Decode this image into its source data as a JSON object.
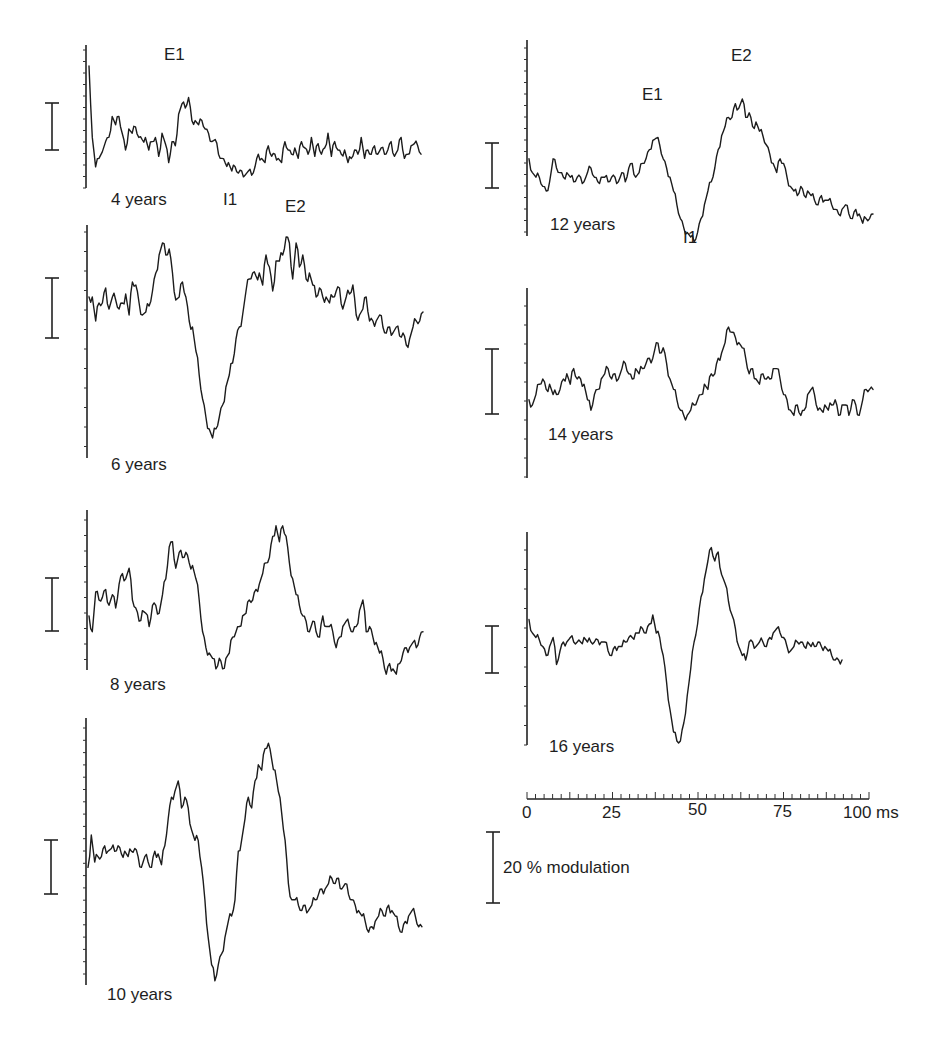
{
  "figure": {
    "time_axis": {
      "tick_labels": [
        "0",
        "25",
        "50",
        "75",
        "100 ms"
      ],
      "label_0": "0",
      "label_25": "25",
      "label_50": "50",
      "label_75": "75",
      "label_100": "100 ms",
      "minor_tick_ms": 2.5,
      "range_ms": [
        0,
        100
      ]
    },
    "amplitude_scale": {
      "label": "20 % modulation",
      "value_percent": 20
    },
    "panel_labels": {
      "p4": "4 years",
      "p6": "6 years",
      "p8": "8 years",
      "p10": "10 years",
      "p12": "12 years",
      "p14": "14 years",
      "p16": "16 years"
    },
    "peak_labels": {
      "p4_E1": "E1",
      "p4_I1": "I1",
      "p4_E2": "E2",
      "p12_E1": "E1",
      "p12_I1": "I1",
      "p12_E2": "E2"
    }
  },
  "chart_data": [
    {
      "type": "line",
      "title": "4 years",
      "xlabel": "Time (ms)",
      "ylabel": "% modulation",
      "xlim": [
        0,
        100
      ],
      "annotations": [
        {
          "text": "E1",
          "x": 24
        },
        {
          "text": "I1",
          "x": 42
        },
        {
          "text": "E2",
          "x": 62
        }
      ],
      "x": [
        0,
        1,
        2,
        3,
        5,
        6,
        7,
        8,
        9,
        10,
        11,
        12,
        13,
        14,
        15,
        16,
        17,
        18,
        19,
        20,
        21,
        22,
        23,
        24,
        25,
        26,
        27,
        28,
        29,
        30,
        31,
        32,
        33,
        34,
        35,
        36,
        37,
        38,
        39,
        40,
        41,
        42,
        43,
        44,
        45,
        46,
        47,
        48,
        49,
        50,
        51,
        52,
        53,
        54,
        55,
        56,
        57,
        58,
        59,
        60,
        61,
        62,
        63,
        64,
        65,
        66,
        67,
        68,
        69,
        70,
        71,
        72,
        73,
        74,
        75,
        76,
        77,
        78,
        79,
        80,
        81,
        82,
        83,
        84,
        85,
        86,
        87,
        88,
        89,
        90,
        91,
        92,
        93,
        94,
        95,
        96,
        97,
        98,
        99,
        100
      ],
      "y": [
        40,
        6,
        -8,
        -4,
        4,
        6,
        16,
        12,
        16,
        8,
        0,
        10,
        8,
        11,
        6,
        5,
        6,
        0,
        4,
        6,
        -3,
        8,
        3,
        -6,
        4,
        2,
        17,
        22,
        20,
        25,
        14,
        14,
        12,
        14,
        10,
        8,
        4,
        5,
        -2,
        -4,
        -6,
        -6,
        -10,
        -8,
        -11,
        -10,
        -12,
        -10,
        -12,
        -8,
        -2,
        -4,
        -6,
        2,
        -3,
        -2,
        -4,
        -6,
        4,
        0,
        -2,
        1,
        -4,
        4,
        1,
        -2,
        6,
        -3,
        3,
        -2,
        1,
        8,
        -3,
        4,
        0,
        -2,
        0,
        -6,
        -4,
        0,
        -2,
        6,
        -4,
        0,
        -2,
        2,
        -2,
        1,
        -2,
        0,
        4,
        -3,
        0,
        6,
        -4,
        -2,
        2,
        3,
        2,
        -2
      ]
    },
    {
      "type": "line",
      "title": "6 years",
      "xlabel": "Time (ms)",
      "ylabel": "% modulation",
      "xlim": [
        0,
        100
      ],
      "x": [
        0,
        1,
        2,
        3,
        4,
        5,
        6,
        7,
        8,
        9,
        10,
        11,
        12,
        13,
        14,
        15,
        16,
        17,
        18,
        19,
        20,
        21,
        22,
        23,
        24,
        25,
        26,
        27,
        28,
        29,
        30,
        31,
        32,
        33,
        34,
        35,
        36,
        37,
        38,
        39,
        40,
        41,
        42,
        43,
        44,
        45,
        46,
        47,
        48,
        49,
        50,
        51,
        52,
        53,
        54,
        55,
        56,
        57,
        58,
        59,
        60,
        61,
        62,
        63,
        64,
        65,
        66,
        67,
        68,
        69,
        70,
        71,
        72,
        73,
        74,
        75,
        76,
        77,
        78,
        79,
        80,
        81,
        82,
        83,
        84,
        85,
        86,
        87,
        88,
        89,
        90,
        91,
        92,
        93,
        94,
        95,
        96,
        97,
        98,
        99,
        100
      ],
      "y": [
        0,
        0,
        -8,
        -2,
        -2,
        3,
        -4,
        0,
        -1,
        -4,
        -2,
        1,
        -6,
        5,
        4,
        -2,
        -6,
        -5,
        -3,
        2,
        8,
        14,
        18,
        14,
        16,
        8,
        -1,
        0,
        5,
        0,
        -8,
        -10,
        -18,
        -26,
        -34,
        -40,
        -44,
        -47,
        -44,
        -40,
        -36,
        -30,
        -26,
        -22,
        -14,
        -10,
        -6,
        2,
        6,
        8,
        7,
        8,
        4,
        14,
        10,
        2,
        12,
        12,
        14,
        20,
        18,
        6,
        18,
        10,
        14,
        6,
        8,
        4,
        0,
        3,
        0,
        0,
        -2,
        0,
        2,
        3,
        -4,
        0,
        1,
        4,
        -6,
        -6,
        -4,
        0,
        -8,
        -8,
        -8,
        -6,
        -10,
        -12,
        -10,
        -12,
        -10,
        -13,
        -12,
        -16,
        -14,
        -10,
        -8,
        -8,
        -5
      ]
    },
    {
      "type": "line",
      "title": "8 years",
      "xlabel": "Time (ms)",
      "ylabel": "% modulation",
      "xlim": [
        0,
        100
      ],
      "x": [
        0,
        1,
        2,
        3,
        4,
        5,
        6,
        7,
        8,
        9,
        10,
        11,
        12,
        13,
        14,
        15,
        16,
        17,
        18,
        19,
        20,
        21,
        22,
        23,
        24,
        25,
        26,
        27,
        28,
        29,
        30,
        31,
        32,
        33,
        34,
        35,
        36,
        37,
        38,
        39,
        40,
        41,
        42,
        43,
        44,
        45,
        46,
        47,
        48,
        49,
        50,
        51,
        52,
        53,
        54,
        55,
        56,
        57,
        58,
        59,
        60,
        61,
        62,
        63,
        64,
        65,
        66,
        67,
        68,
        69,
        70,
        71,
        72,
        73,
        74,
        75,
        76,
        77,
        78,
        79,
        80,
        81,
        82,
        83,
        84,
        85,
        86,
        87,
        88,
        89,
        90,
        91,
        92,
        93,
        94,
        95,
        96,
        97,
        98,
        99,
        100
      ],
      "y": [
        -6,
        -12,
        3,
        0,
        1,
        4,
        -2,
        2,
        -3,
        6,
        10,
        8,
        12,
        0,
        -3,
        -8,
        -4,
        -5,
        -10,
        -2,
        -2,
        -5,
        2,
        8,
        20,
        22,
        12,
        18,
        16,
        18,
        14,
        13,
        8,
        0,
        -12,
        -18,
        -20,
        -22,
        -26,
        -22,
        -26,
        -22,
        -20,
        -14,
        -12,
        -10,
        -6,
        -5,
        0,
        0,
        4,
        6,
        10,
        14,
        16,
        24,
        28,
        22,
        28,
        24,
        14,
        8,
        2,
        -2,
        -6,
        -8,
        -12,
        -8,
        -12,
        -14,
        -6,
        -10,
        -10,
        -12,
        -18,
        -14,
        -10,
        -8,
        -10,
        -12,
        -10,
        -4,
        0,
        -12,
        -10,
        -14,
        -16,
        -20,
        -22,
        -28,
        -24,
        -26,
        -28,
        -24,
        -20,
        -18,
        -18,
        -16,
        -18,
        -14,
        -12
      ]
    },
    {
      "type": "line",
      "title": "10 years",
      "xlabel": "Time (ms)",
      "ylabel": "% modulation",
      "xlim": [
        0,
        100
      ],
      "x": [
        0,
        1,
        2,
        3,
        4,
        5,
        6,
        7,
        8,
        9,
        10,
        11,
        12,
        13,
        14,
        15,
        16,
        17,
        18,
        19,
        20,
        21,
        22,
        23,
        24,
        25,
        26,
        27,
        28,
        29,
        30,
        31,
        32,
        33,
        34,
        35,
        36,
        37,
        38,
        39,
        40,
        41,
        42,
        43,
        44,
        45,
        46,
        47,
        48,
        49,
        50,
        51,
        52,
        53,
        54,
        55,
        56,
        57,
        58,
        59,
        60,
        61,
        62,
        63,
        64,
        65,
        66,
        67,
        68,
        69,
        70,
        71,
        72,
        73,
        74,
        75,
        76,
        77,
        78,
        79,
        80,
        81,
        82,
        83,
        84,
        85,
        86,
        87,
        88,
        89,
        90,
        91,
        92,
        93,
        94,
        95,
        96,
        97,
        98,
        99,
        100
      ],
      "y": [
        -2,
        10,
        0,
        2,
        2,
        6,
        4,
        5,
        4,
        6,
        3,
        4,
        2,
        4,
        5,
        2,
        -2,
        2,
        0,
        -2,
        4,
        3,
        -1,
        6,
        16,
        24,
        26,
        30,
        20,
        24,
        20,
        12,
        8,
        8,
        -2,
        -14,
        -28,
        -38,
        -44,
        -38,
        -34,
        -28,
        -22,
        -20,
        -14,
        4,
        8,
        16,
        24,
        20,
        30,
        36,
        34,
        42,
        44,
        38,
        34,
        26,
        18,
        8,
        -8,
        -14,
        -14,
        -16,
        -18,
        -16,
        -18,
        -16,
        -14,
        -12,
        -10,
        -10,
        -8,
        -6,
        -8,
        -6,
        -10,
        -8,
        -12,
        -14,
        -16,
        -18,
        -20,
        -22,
        -26,
        -24,
        -22,
        -20,
        -18,
        -20,
        -16,
        -18,
        -20,
        -24,
        -26,
        -22,
        -20,
        -18,
        -20,
        -24,
        -24
      ]
    },
    {
      "type": "line",
      "title": "12 years",
      "xlabel": "Time (ms)",
      "ylabel": "% modulation",
      "xlim": [
        0,
        100
      ],
      "annotations": [
        {
          "text": "E1",
          "x": 36
        },
        {
          "text": "I1",
          "x": 48
        },
        {
          "text": "E2",
          "x": 62
        }
      ],
      "x": [
        0,
        1,
        2,
        3,
        4,
        5,
        6,
        7,
        8,
        9,
        10,
        11,
        12,
        13,
        14,
        15,
        16,
        17,
        18,
        19,
        20,
        21,
        22,
        23,
        24,
        25,
        26,
        27,
        28,
        29,
        30,
        31,
        32,
        33,
        34,
        35,
        36,
        37,
        38,
        39,
        40,
        41,
        42,
        43,
        44,
        45,
        46,
        47,
        48,
        49,
        50,
        51,
        52,
        53,
        54,
        55,
        56,
        57,
        58,
        59,
        60,
        61,
        62,
        63,
        64,
        65,
        66,
        67,
        68,
        69,
        70,
        71,
        72,
        73,
        74,
        75,
        76,
        77,
        78,
        79,
        80,
        81,
        82,
        83,
        84,
        85,
        86,
        87,
        88,
        89,
        90,
        91,
        92,
        93,
        94,
        95,
        96,
        97,
        98,
        99,
        100
      ],
      "y": [
        4,
        -2,
        -4,
        -4,
        -8,
        -10,
        -6,
        4,
        0,
        -2,
        -4,
        -2,
        -4,
        -6,
        -4,
        -4,
        -6,
        -2,
        0,
        -4,
        -6,
        -4,
        -4,
        -6,
        -4,
        -4,
        -6,
        -2,
        -6,
        0,
        2,
        -4,
        -2,
        2,
        4,
        8,
        12,
        13,
        10,
        4,
        0,
        -4,
        -10,
        -16,
        -22,
        -26,
        -28,
        -30,
        -32,
        -28,
        -22,
        -16,
        -10,
        -6,
        0,
        8,
        14,
        18,
        22,
        22,
        28,
        26,
        30,
        22,
        24,
        18,
        20,
        16,
        14,
        10,
        6,
        2,
        -2,
        4,
        2,
        -4,
        -8,
        -10,
        -12,
        -8,
        -12,
        -10,
        -12,
        -14,
        -16,
        -12,
        -14,
        -14,
        -16,
        -18,
        -20,
        -18,
        -16,
        -20,
        -22,
        -18,
        -20,
        -24,
        -22,
        -22,
        -20
      ]
    },
    {
      "type": "line",
      "title": "14 years",
      "xlabel": "Time (ms)",
      "ylabel": "% modulation",
      "xlim": [
        0,
        100
      ],
      "x": [
        0,
        1,
        2,
        3,
        4,
        5,
        6,
        7,
        8,
        9,
        10,
        11,
        12,
        13,
        14,
        15,
        16,
        17,
        18,
        19,
        20,
        21,
        22,
        23,
        24,
        25,
        26,
        27,
        28,
        29,
        30,
        31,
        32,
        33,
        34,
        35,
        36,
        37,
        38,
        39,
        40,
        41,
        42,
        43,
        44,
        45,
        46,
        47,
        48,
        49,
        50,
        51,
        52,
        53,
        54,
        55,
        56,
        57,
        58,
        59,
        60,
        61,
        62,
        63,
        64,
        65,
        66,
        67,
        68,
        69,
        70,
        71,
        72,
        73,
        74,
        75,
        76,
        77,
        78,
        79,
        80,
        81,
        82,
        83,
        84,
        85,
        86,
        87,
        88,
        89,
        90,
        91,
        92,
        93,
        94,
        95,
        96,
        97,
        98,
        99,
        100
      ],
      "y": [
        2,
        0,
        4,
        8,
        10,
        6,
        8,
        4,
        4,
        6,
        10,
        12,
        8,
        14,
        10,
        10,
        8,
        2,
        -2,
        4,
        6,
        10,
        12,
        14,
        10,
        12,
        10,
        14,
        16,
        12,
        10,
        14,
        12,
        14,
        16,
        18,
        18,
        24,
        20,
        22,
        16,
        10,
        6,
        2,
        -2,
        -4,
        -4,
        -2,
        0,
        2,
        4,
        8,
        6,
        12,
        12,
        18,
        20,
        24,
        30,
        28,
        26,
        24,
        22,
        18,
        12,
        14,
        10,
        8,
        12,
        10,
        10,
        14,
        14,
        10,
        4,
        2,
        -2,
        -4,
        0,
        -4,
        -2,
        4,
        6,
        4,
        -2,
        -2,
        0,
        -2,
        0,
        2,
        -4,
        0,
        0,
        -4,
        2,
        0,
        -4,
        2,
        6,
        6,
        6
      ]
    },
    {
      "type": "line",
      "title": "16 years",
      "xlabel": "Time (ms)",
      "ylabel": "% modulation",
      "xlim": [
        0,
        100
      ],
      "x": [
        0,
        1,
        2,
        3,
        4,
        5,
        6,
        7,
        8,
        9,
        10,
        11,
        12,
        13,
        14,
        15,
        16,
        17,
        18,
        19,
        20,
        21,
        22,
        23,
        24,
        25,
        26,
        27,
        28,
        29,
        30,
        31,
        32,
        33,
        34,
        35,
        36,
        37,
        38,
        39,
        40,
        41,
        42,
        43,
        44,
        45,
        46,
        47,
        48,
        49,
        50,
        51,
        52,
        53,
        54,
        55,
        56,
        57,
        58,
        59,
        60,
        61,
        62,
        63,
        64,
        65,
        66,
        67,
        68,
        69,
        70,
        71,
        72,
        73,
        74,
        75,
        76,
        77,
        78,
        79,
        80,
        81,
        82,
        83,
        84,
        85,
        86,
        87,
        88,
        89,
        90,
        91,
        92,
        93,
        94,
        95,
        96,
        97,
        98,
        99,
        100
      ],
      "y": [
        10,
        4,
        2,
        1,
        -2,
        -6,
        -2,
        2,
        -10,
        -4,
        0,
        0,
        2,
        0,
        0,
        0,
        2,
        0,
        0,
        0,
        1,
        0,
        0,
        -4,
        -6,
        -2,
        -2,
        -2,
        0,
        2,
        2,
        4,
        4,
        6,
        4,
        8,
        12,
        4,
        2,
        -6,
        -18,
        -30,
        -40,
        -44,
        -44,
        -36,
        -24,
        -12,
        0,
        8,
        20,
        28,
        36,
        42,
        36,
        40,
        30,
        26,
        18,
        12,
        6,
        -2,
        -6,
        -8,
        0,
        0,
        -2,
        0,
        0,
        -2,
        2,
        4,
        6,
        4,
        2,
        -2,
        -4,
        -2,
        0,
        0,
        -2,
        0,
        -2,
        -2,
        0,
        -2,
        -2,
        -4,
        -6,
        -8,
        -8,
        -8
      ]
    }
  ]
}
